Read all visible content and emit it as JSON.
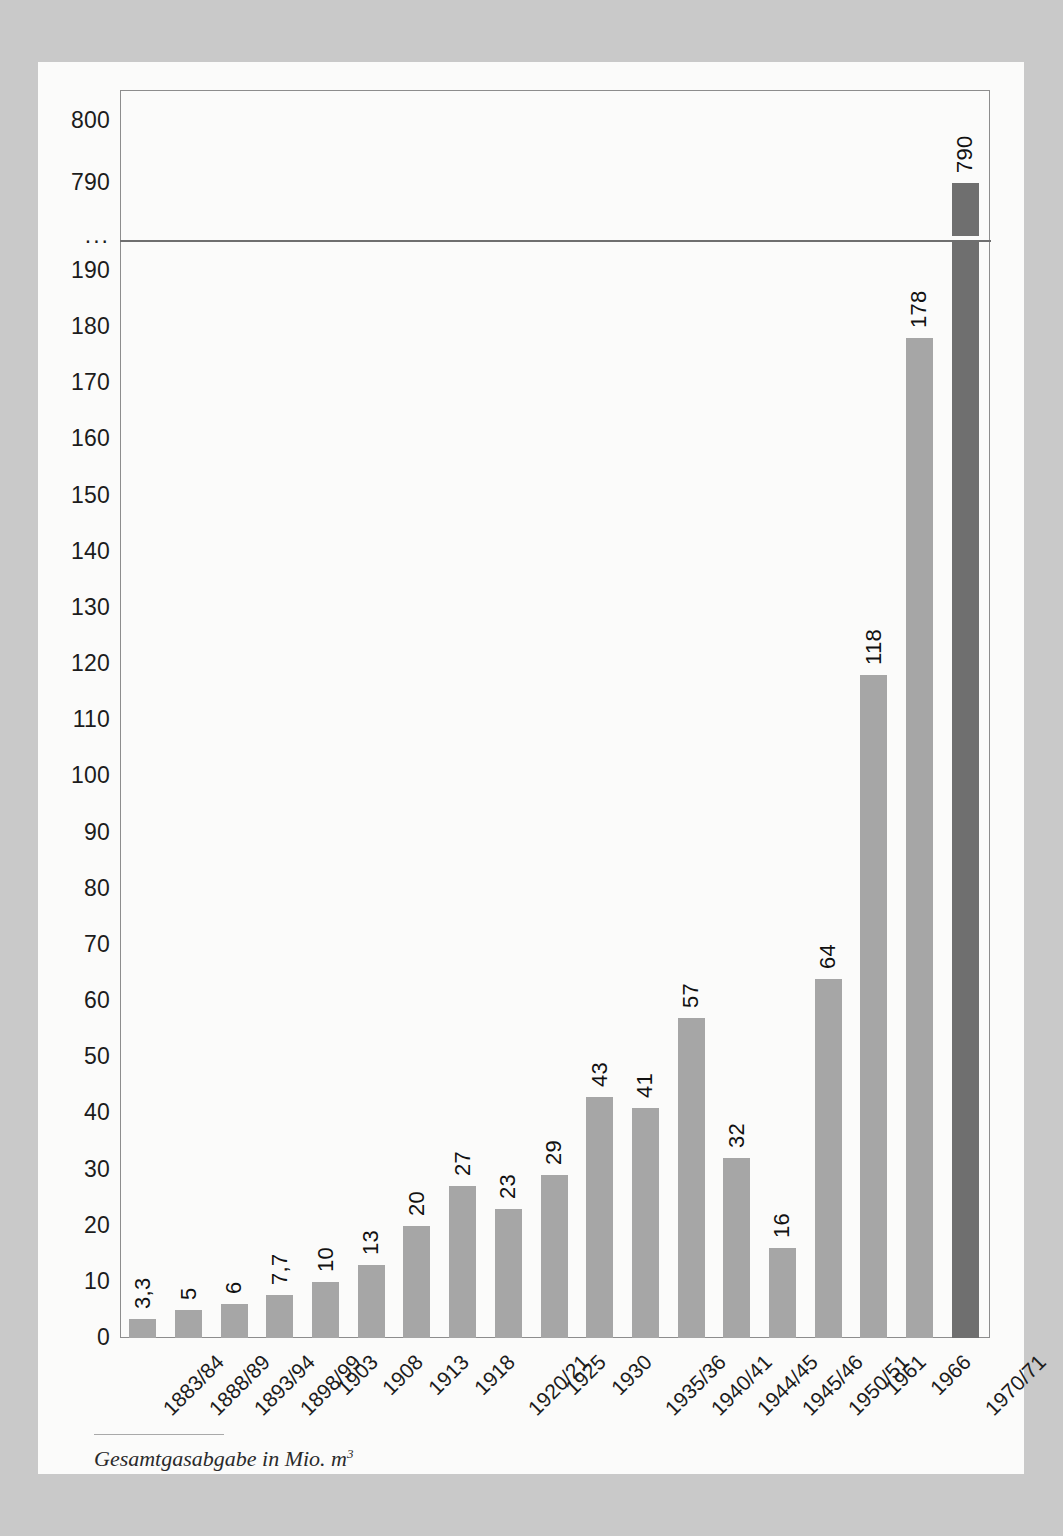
{
  "caption": {
    "text": "Gesamtgasabgabe in Mio. m",
    "superscript": "3"
  },
  "chart_data": {
    "type": "bar",
    "title": "",
    "xlabel": "",
    "ylabel": "Gesamtgasabgabe in Mio. m3",
    "categories": [
      "1883/84",
      "1888/89",
      "1893/94",
      "1898/99",
      "1903",
      "1908",
      "1913",
      "1918",
      "1920/21",
      "1925",
      "1930",
      "1935/36",
      "1940/41",
      "1944/45",
      "1945/46",
      "1950/51",
      "1961",
      "1966",
      "1970/71"
    ],
    "values": [
      3.3,
      5,
      6,
      7.7,
      10,
      13,
      20,
      27,
      23,
      29,
      43,
      41,
      57,
      32,
      16,
      64,
      118,
      178,
      790
    ],
    "value_labels": [
      "3,3",
      "5",
      "6",
      "7,7",
      "10",
      "13",
      "20",
      "27",
      "23",
      "29",
      "43",
      "41",
      "57",
      "32",
      "16",
      "64",
      "118",
      "178",
      "790"
    ],
    "bar_colors": [
      "#a6a6a6",
      "#a6a6a6",
      "#a6a6a6",
      "#a6a6a6",
      "#a6a6a6",
      "#a6a6a6",
      "#a6a6a6",
      "#a6a6a6",
      "#a6a6a6",
      "#a6a6a6",
      "#a6a6a6",
      "#a6a6a6",
      "#a6a6a6",
      "#a6a6a6",
      "#a6a6a6",
      "#a6a6a6",
      "#a6a6a6",
      "#a6a6a6",
      "#6f6f6f"
    ],
    "accent_index": 18,
    "ytick_labels": [
      "800",
      "790",
      "...",
      "190",
      "180",
      "170",
      "160",
      "150",
      "140",
      "130",
      "120",
      "110",
      "100",
      "90",
      "80",
      "70",
      "60",
      "50",
      "40",
      "30",
      "20",
      "10",
      "0"
    ],
    "ytick_values": [
      800,
      790,
      null,
      190,
      180,
      170,
      160,
      150,
      140,
      130,
      120,
      110,
      100,
      90,
      80,
      70,
      60,
      50,
      40,
      30,
      20,
      10,
      0
    ],
    "axis_break": {
      "marker": "...",
      "lower_max": 190,
      "upper_min": 790,
      "upper_max": 800
    },
    "ylim": [
      0,
      800
    ],
    "grid": false,
    "legend": false,
    "colors": {
      "bar": "#a6a6a6",
      "bar_accent": "#6f6f6f",
      "frame": "#8d8d8d",
      "break_line": "#6f6f6f",
      "page": "#fbfbfa",
      "background": "#c9c9c9",
      "text": "#1c1c1c"
    }
  }
}
